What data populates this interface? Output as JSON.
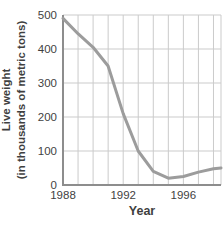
{
  "chart_data": {
    "type": "line",
    "title": "",
    "xlabel": "Year",
    "ylabel": "Live weight (in thousands of metric tons)",
    "ylabel_lines": [
      "Live weight",
      "(in thousands of metric tons)"
    ],
    "x": [
      1988,
      1989,
      1990,
      1991,
      1992,
      1993,
      1994,
      1995,
      1996,
      1997,
      1998,
      1998.5
    ],
    "values": [
      490,
      445,
      405,
      350,
      210,
      100,
      40,
      20,
      25,
      38,
      48,
      50
    ],
    "xlim": [
      1988,
      1998.5
    ],
    "ylim": [
      0,
      500
    ],
    "y_ticks": [
      0,
      100,
      200,
      300,
      400,
      500
    ],
    "x_tick_labels": [
      {
        "value": 1988,
        "label": "1988"
      },
      {
        "value": 1992,
        "label": "1992"
      },
      {
        "value": 1996,
        "label": "1996"
      }
    ],
    "x_gridline_step": 1,
    "grid": true,
    "legend": "none",
    "colors": {
      "line": "#9c9c9c",
      "grid": "#cbcbcb",
      "axis": "#8d8d8d",
      "text": "#3f3f3f",
      "background": "#ffffff"
    }
  }
}
